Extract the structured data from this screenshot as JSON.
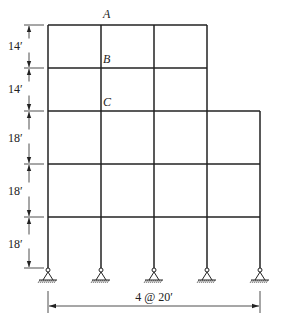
{
  "figure": {
    "type": "multistory-frame",
    "bays": 4,
    "bay_width_label": "4 @ 20′",
    "story_heights_labels": [
      "14′",
      "14′",
      "18′",
      "18′",
      "18′"
    ],
    "joint_labels": [
      "A",
      "B",
      "C"
    ],
    "support_type": "pinned",
    "stroke_color": "#222222"
  }
}
